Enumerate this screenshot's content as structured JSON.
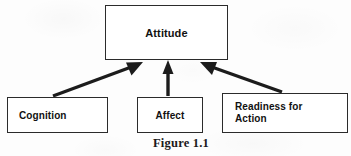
{
  "figure": {
    "caption": "Figure 1.1",
    "background_color": "#fdfdfd",
    "line_color": "#2b2b2b",
    "text_color": "#111111"
  },
  "nodes": {
    "attitude": {
      "label": "Attitude",
      "role": "parent-construct"
    },
    "cognition": {
      "label": "Cognition",
      "role": "component"
    },
    "affect": {
      "label": "Affect",
      "role": "component"
    },
    "readiness": {
      "label_line_1": "Readiness for",
      "label_line_2": "Action",
      "role": "component"
    }
  },
  "connections": [
    {
      "id": "cognition-to-attitude",
      "from": "cognition",
      "to": "attitude",
      "style": "solid-arrow",
      "direction": "up-right"
    },
    {
      "id": "affect-to-attitude",
      "from": "affect",
      "to": "attitude",
      "style": "solid-arrow",
      "direction": "up"
    },
    {
      "id": "readiness-to-attitude",
      "from": "readiness",
      "to": "attitude",
      "style": "solid-arrow",
      "direction": "up-left"
    }
  ]
}
